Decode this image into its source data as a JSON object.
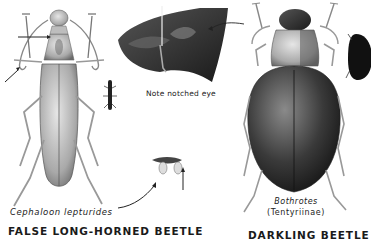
{
  "plate": {
    "beetles": [
      {
        "id": "false-long-horned",
        "common_name": "FALSE LONG-HORNED BEETLE",
        "species": "Cephaloon lepturides"
      },
      {
        "id": "darkling",
        "common_name": "DARKLING BEETLE",
        "species": "Bothrotes",
        "subfamily": "(Tentyriinae)"
      }
    ],
    "annotations": {
      "eye_note": "Note notched eye"
    },
    "colors": {
      "background": "#ffffff",
      "ink": "#111111",
      "light_body": "#cfcfcf",
      "dark_body": "#2a2a2a"
    }
  }
}
